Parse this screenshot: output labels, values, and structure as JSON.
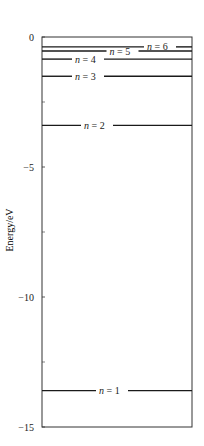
{
  "chart_data": {
    "type": "diagram",
    "ylabel": "Energy/eV",
    "ylim": [
      -15,
      0
    ],
    "yticks": [
      {
        "value": 0,
        "label": "0"
      },
      {
        "value": -5,
        "label": "−5"
      },
      {
        "value": -10,
        "label": "−10"
      },
      {
        "value": -15,
        "label": "−15"
      }
    ],
    "minor_ticks": [
      -2.5,
      -7.5,
      -12.5
    ],
    "levels": [
      {
        "n": 1,
        "energy": -13.6,
        "label": "n = 1",
        "label_x": 0.38
      },
      {
        "n": 2,
        "energy": -3.4,
        "label": "n = 2",
        "label_x": 0.28
      },
      {
        "n": 3,
        "energy": -1.51,
        "label": "n = 3",
        "label_x": 0.22
      },
      {
        "n": 4,
        "energy": -0.85,
        "label": "n = 4",
        "label_x": 0.22
      },
      {
        "n": 5,
        "energy": -0.54,
        "label": "n = 5",
        "label_x": 0.45
      },
      {
        "n": 6,
        "energy": -0.38,
        "label": "n = 6",
        "label_x": 0.7
      }
    ]
  },
  "colors": {
    "line": "#1a1a1a",
    "frame": "#333333",
    "text": "#1a1a1a"
  }
}
